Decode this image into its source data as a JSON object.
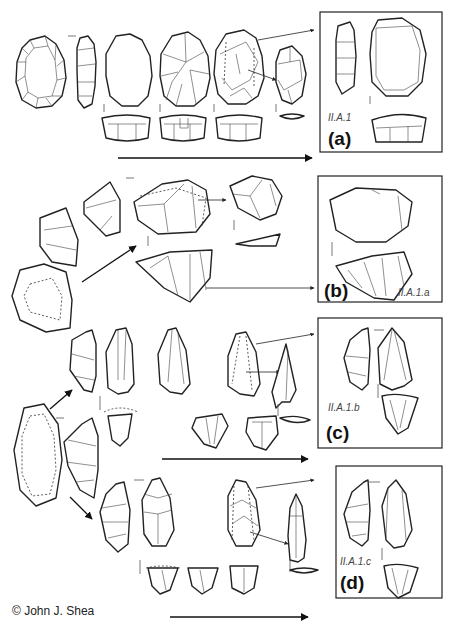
{
  "figure": {
    "panels": [
      {
        "letter": "(a)",
        "type_code": "II.A.1"
      },
      {
        "letter": "(b)",
        "type_code": "II.A.1.a"
      },
      {
        "letter": "(c)",
        "type_code": "II.A.1.b"
      },
      {
        "letter": "(d)",
        "type_code": "II.A.1.c"
      }
    ],
    "credit": "© John J. Shea"
  },
  "colors": {
    "line": "#222222",
    "background": "#ffffff"
  }
}
